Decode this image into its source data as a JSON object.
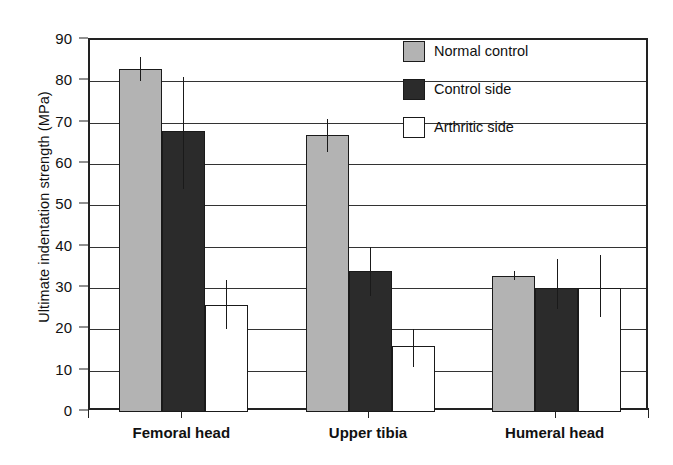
{
  "chart_data": {
    "type": "bar",
    "title": "",
    "xlabel": "",
    "ylabel": "Ultimate indentation strength (MPa)",
    "ylim": [
      0,
      90
    ],
    "ytick_step": 10,
    "yticks": [
      90,
      80,
      70,
      60,
      50,
      40,
      30,
      20,
      10,
      0
    ],
    "ytick_labels": [
      "90",
      "80",
      "70",
      "60",
      "50",
      "40",
      "30",
      "20",
      "10",
      "0"
    ],
    "grid": "horizontal",
    "legend_position": "upper-right",
    "categories": [
      "Femoral head",
      "Upper tibia",
      "Humeral head"
    ],
    "series": [
      {
        "name": "Normal control",
        "color": "#b3b3b3",
        "values": [
          83,
          67,
          33
        ],
        "error_low": [
          80,
          63,
          32
        ],
        "error_high": [
          86,
          71,
          34
        ]
      },
      {
        "name": "Control side",
        "color": "#2b2b2b",
        "values": [
          68,
          34,
          30
        ],
        "error_low": [
          54,
          28,
          25
        ],
        "error_high": [
          81,
          40,
          37
        ]
      },
      {
        "name": "Arthritic side",
        "color": "#ffffff",
        "values": [
          26,
          16,
          30
        ],
        "error_low": [
          20,
          11,
          23
        ],
        "error_high": [
          32,
          20,
          38
        ]
      }
    ]
  },
  "legend": {
    "items": [
      {
        "label": "Normal control",
        "swatch": "normal"
      },
      {
        "label": "Control side",
        "swatch": "control"
      },
      {
        "label": "Arthritic side",
        "swatch": "arthritic"
      }
    ]
  },
  "axis": {
    "y_title": "Ultimate indentation strength (MPa)"
  }
}
